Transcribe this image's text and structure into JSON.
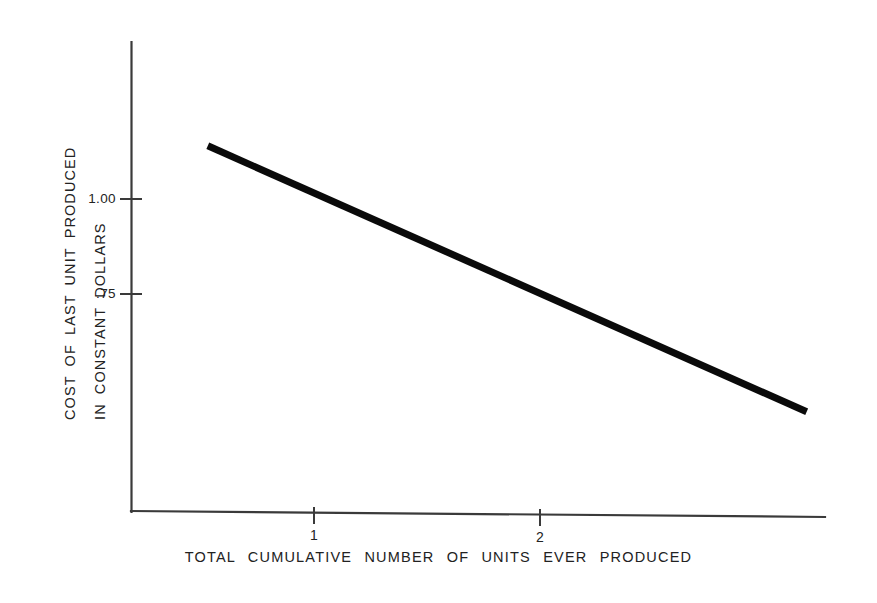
{
  "figure": {
    "background_color": "#ffffff",
    "ink_color": "#0a0a0a",
    "axis_color": "#3a3a3a"
  },
  "axes": {
    "y_title_line1": "COST OF LAST UNIT PRODUCED",
    "y_title_line2": "IN CONSTANT DOLLARS",
    "x_title": "TOTAL CUMULATIVE NUMBER OF UNITS EVER PRODUCED",
    "y_ticks": [
      {
        "label": "1.00",
        "value": 1.0
      },
      {
        "label": ".75",
        "value": 0.75
      }
    ],
    "x_ticks": [
      {
        "label": "1",
        "value": 1
      },
      {
        "label": "2",
        "value": 2
      }
    ]
  },
  "chart_data": {
    "type": "line",
    "title": "",
    "subtitle": "",
    "xlabel": "TOTAL CUMULATIVE NUMBER OF UNITS EVER PRODUCED",
    "ylabel": "COST OF LAST UNIT PRODUCED IN CONSTANT DOLLARS",
    "xlim": [
      0,
      3.6
    ],
    "ylim": [
      0.22,
      1.31
    ],
    "xticks": [
      1,
      2
    ],
    "xticklabels": [
      "1",
      "2"
    ],
    "yticks": [
      1.0,
      0.75
    ],
    "yticklabels": [
      "1.00",
      ".75"
    ],
    "grid": false,
    "legend": false,
    "legend_position": "none",
    "series": [
      {
        "name": "learning curve",
        "x": [
          0.53,
          3.18
        ],
        "values": [
          1.14,
          0.44
        ],
        "style": "solid",
        "linewidth_px": 7,
        "color": "#0a0a0a"
      }
    ],
    "annotations": []
  }
}
